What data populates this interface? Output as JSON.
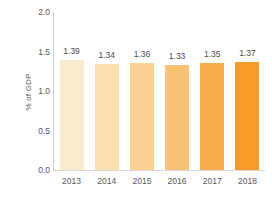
{
  "chart_data": {
    "type": "bar",
    "title": "",
    "subtitle": "",
    "xlabel": "",
    "ylabel": "% of GDP",
    "categories": [
      "2013",
      "2014",
      "2015",
      "2016",
      "2017",
      "2018"
    ],
    "values": [
      1.39,
      1.34,
      1.36,
      1.33,
      1.35,
      1.37
    ],
    "value_labels": [
      "1.39",
      "1.34",
      "1.36",
      "1.33",
      "1.35",
      "1.37"
    ],
    "ylim": [
      0.0,
      2.0
    ],
    "ytick_labels": [
      "2.0",
      "1.5",
      "1.0",
      "0.5",
      "0.0"
    ],
    "ytick_values": [
      2.0,
      1.5,
      1.0,
      0.5,
      0.0
    ],
    "grid": false,
    "legend": null,
    "legend_position": "none",
    "bar_colors": [
      "#FAEBCE",
      "#FBE0B0",
      "#FBD293",
      "#FAC madrid",
      "#F8AE4E",
      "#F89B28"
    ],
    "colors": {
      "bars": [
        "#FAEBCE",
        "#FAE0B2",
        "#FBD294",
        "#FAC476",
        "#F9AF50",
        "#F89B28"
      ],
      "axis_line": "#c9c9c9",
      "baseline": "#d8d8d8",
      "tick_text": "#58585a",
      "value_text": "#4a4a4c",
      "background": "#ffffff"
    }
  }
}
